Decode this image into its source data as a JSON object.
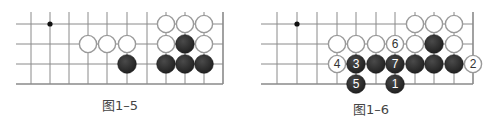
{
  "colors": {
    "grid": "#8a8a8a",
    "black_stone": "#2a2a2a",
    "white_stone_fill": "#ffffff",
    "white_stone_edge": "#9a9a9a",
    "caption": "#444444"
  },
  "diagrams": [
    {
      "caption": "图1–5",
      "caption_x": 120,
      "caption_y": 95,
      "grid": {
        "x_lines": [
          31,
          50,
          69,
          88,
          107,
          127,
          147,
          166,
          185,
          204,
          223
        ],
        "y_lines": [
          24,
          44,
          64,
          84
        ],
        "left": 16,
        "top": 12,
        "right_edge": 223,
        "bottom_edge": 84
      },
      "star_points": [
        [
          50,
          24
        ]
      ],
      "stones": [
        {
          "x": 166,
          "y": 24,
          "color": "white",
          "label": ""
        },
        {
          "x": 185,
          "y": 24,
          "color": "white",
          "label": ""
        },
        {
          "x": 204,
          "y": 24,
          "color": "white",
          "label": ""
        },
        {
          "x": 88,
          "y": 44,
          "color": "white",
          "label": ""
        },
        {
          "x": 107,
          "y": 44,
          "color": "white",
          "label": ""
        },
        {
          "x": 127,
          "y": 44,
          "color": "white",
          "label": ""
        },
        {
          "x": 166,
          "y": 44,
          "color": "white",
          "label": ""
        },
        {
          "x": 185,
          "y": 44,
          "color": "black",
          "label": ""
        },
        {
          "x": 204,
          "y": 44,
          "color": "white",
          "label": ""
        },
        {
          "x": 127,
          "y": 64,
          "color": "black",
          "label": ""
        },
        {
          "x": 166,
          "y": 64,
          "color": "black",
          "label": ""
        },
        {
          "x": 185,
          "y": 64,
          "color": "black",
          "label": ""
        },
        {
          "x": 204,
          "y": 64,
          "color": "black",
          "label": ""
        }
      ]
    },
    {
      "caption": "图1–6",
      "caption_x": 371,
      "caption_y": 99,
      "grid": {
        "x_lines": [
          277,
          297,
          317,
          337,
          356,
          376,
          395,
          415,
          434,
          454,
          473
        ],
        "y_lines": [
          24,
          44,
          64,
          84
        ],
        "left": 261,
        "top": 12,
        "right_edge": 473,
        "bottom_edge": 84
      },
      "star_points": [
        [
          297,
          24
        ]
      ],
      "stones": [
        {
          "x": 415,
          "y": 24,
          "color": "white",
          "label": ""
        },
        {
          "x": 434,
          "y": 24,
          "color": "white",
          "label": ""
        },
        {
          "x": 454,
          "y": 24,
          "color": "white",
          "label": ""
        },
        {
          "x": 337,
          "y": 44,
          "color": "white",
          "label": ""
        },
        {
          "x": 356,
          "y": 44,
          "color": "white",
          "label": ""
        },
        {
          "x": 376,
          "y": 44,
          "color": "white",
          "label": ""
        },
        {
          "x": 395,
          "y": 44,
          "color": "white",
          "label": "6"
        },
        {
          "x": 415,
          "y": 44,
          "color": "white",
          "label": ""
        },
        {
          "x": 434,
          "y": 44,
          "color": "black",
          "label": ""
        },
        {
          "x": 454,
          "y": 44,
          "color": "white",
          "label": ""
        },
        {
          "x": 337,
          "y": 64,
          "color": "white",
          "label": "4"
        },
        {
          "x": 356,
          "y": 64,
          "color": "black",
          "label": "3"
        },
        {
          "x": 376,
          "y": 64,
          "color": "black",
          "label": ""
        },
        {
          "x": 395,
          "y": 64,
          "color": "black",
          "label": "7"
        },
        {
          "x": 415,
          "y": 64,
          "color": "black",
          "label": ""
        },
        {
          "x": 434,
          "y": 64,
          "color": "black",
          "label": ""
        },
        {
          "x": 454,
          "y": 64,
          "color": "black",
          "label": ""
        },
        {
          "x": 473,
          "y": 64,
          "color": "white",
          "label": "2"
        },
        {
          "x": 356,
          "y": 84,
          "color": "black",
          "label": "5"
        },
        {
          "x": 395,
          "y": 84,
          "color": "black",
          "label": "1"
        }
      ]
    }
  ]
}
